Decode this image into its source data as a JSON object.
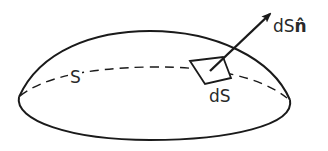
{
  "diagram": {
    "labels": {
      "surface": "S",
      "element": "dS",
      "vector_prefix": "dS",
      "vector_unit": "n̂"
    },
    "colors": {
      "stroke": "#1a1a1a",
      "text": "#2a2a2a",
      "background": "#ffffff"
    }
  }
}
